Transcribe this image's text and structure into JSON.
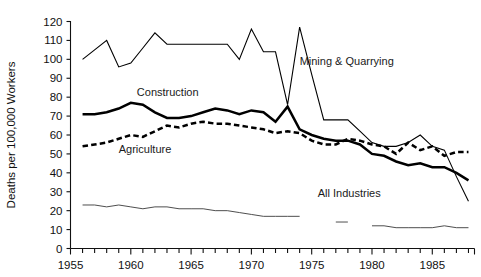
{
  "chart_data": {
    "type": "line",
    "title": "",
    "xlabel": "",
    "ylabel": "Deaths per 100,000 Workers",
    "xlim": [
      1955,
      1988.5
    ],
    "ylim": [
      0,
      120
    ],
    "yticks": [
      0,
      10,
      20,
      30,
      40,
      50,
      60,
      70,
      80,
      90,
      100,
      110,
      120
    ],
    "xticks_major": [
      1955,
      1960,
      1965,
      1970,
      1975,
      1980,
      1985
    ],
    "xtick_minor_step": 1,
    "grid": false,
    "legend": "inline-annotations",
    "series": [
      {
        "name": "Mining & Quarrying",
        "style": "solid-thin",
        "label_x": 1974.0,
        "label_y": 97,
        "x": [
          1956,
          1957,
          1958,
          1959,
          1960,
          1961,
          1962,
          1963,
          1964,
          1965,
          1966,
          1967,
          1968,
          1969,
          1970,
          1971,
          1972,
          1973,
          1974,
          1975,
          1976,
          1977,
          1978,
          1979,
          1980,
          1981,
          1982,
          1983,
          1984,
          1985,
          1986,
          1987,
          1988
        ],
        "y": [
          100,
          105,
          110,
          96,
          98,
          106,
          114,
          108,
          108,
          108,
          108,
          108,
          108,
          100,
          116,
          104,
          104,
          76,
          117,
          92,
          68,
          68,
          68,
          62,
          56,
          54,
          54,
          56,
          60,
          54,
          52,
          38,
          25
        ]
      },
      {
        "name": "Construction",
        "style": "solid-thick",
        "label_x": 1960.5,
        "label_y": 80.5,
        "x": [
          1956,
          1957,
          1958,
          1959,
          1960,
          1961,
          1962,
          1963,
          1964,
          1965,
          1966,
          1967,
          1968,
          1969,
          1970,
          1971,
          1972,
          1973,
          1974,
          1975,
          1976,
          1977,
          1978,
          1979,
          1980,
          1981,
          1982,
          1983,
          1984,
          1985,
          1986,
          1987,
          1988
        ],
        "y": [
          71,
          71,
          72,
          74,
          77,
          76,
          72,
          69,
          69,
          70,
          72,
          74,
          73,
          71,
          73,
          72,
          67,
          75,
          63,
          60,
          58,
          57,
          57,
          55,
          50,
          49,
          46,
          44,
          45,
          43,
          43,
          40,
          36
        ]
      },
      {
        "name": "Agriculture",
        "style": "dashed",
        "label_x": 1959.0,
        "label_y": 50.5,
        "x": [
          1956,
          1957,
          1958,
          1959,
          1960,
          1961,
          1962,
          1963,
          1964,
          1965,
          1966,
          1967,
          1968,
          1969,
          1970,
          1971,
          1972,
          1973,
          1974,
          1975,
          1976,
          1977,
          1978,
          1979,
          1980,
          1981,
          1982,
          1983,
          1984,
          1985,
          1986,
          1987,
          1988
        ],
        "y": [
          54,
          55,
          56,
          58,
          60,
          59,
          62,
          65,
          64,
          66,
          67,
          66,
          66,
          65,
          64,
          63,
          61,
          62,
          61,
          57,
          55,
          55,
          58,
          57,
          55,
          54,
          50,
          56,
          52,
          54,
          49,
          51,
          51
        ]
      },
      {
        "name": "All Industries",
        "style": "solid-hair",
        "label_x": 1975.5,
        "label_y": 27,
        "segments": [
          {
            "x": [
              1956,
              1957,
              1958,
              1959,
              1960,
              1961,
              1962,
              1963,
              1964,
              1965,
              1966,
              1967,
              1968,
              1969,
              1970,
              1971,
              1972,
              1973,
              1974
            ],
            "y": [
              23,
              23,
              22,
              23,
              22,
              21,
              22,
              22,
              21,
              21,
              21,
              20,
              20,
              19,
              18,
              17,
              17,
              17,
              17
            ]
          },
          {
            "x": [
              1977,
              1978
            ],
            "y": [
              14,
              14
            ]
          },
          {
            "x": [
              1980,
              1981,
              1982,
              1983,
              1984,
              1985,
              1986,
              1987,
              1988
            ],
            "y": [
              12,
              12,
              11,
              11,
              11,
              11,
              12,
              11,
              11
            ]
          }
        ]
      }
    ]
  }
}
